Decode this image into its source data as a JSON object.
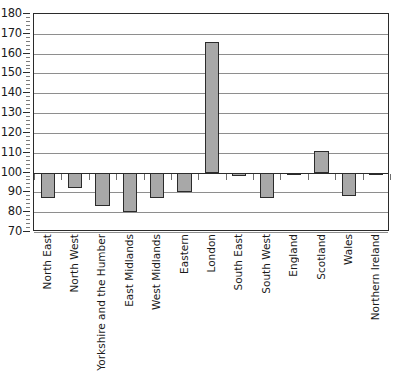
{
  "chart_data": {
    "type": "bar",
    "title": "",
    "subtitle": "",
    "xlabel": "",
    "ylabel": "",
    "categories": [
      "North East",
      "North West",
      "Yorkshire and the Humber",
      "East Midlands",
      "West Midlands",
      "Eastern",
      "London",
      "South East",
      "South West",
      "England",
      "Scotland",
      "Wales",
      "Northern Ireland"
    ],
    "values": [
      87,
      92,
      83,
      80,
      87,
      90,
      166,
      98,
      87,
      99,
      111,
      88,
      100
    ],
    "baseline": 100,
    "ylim": [
      70,
      180
    ],
    "ytick_labels": [
      "180",
      "170",
      "160",
      "150",
      "140",
      "130",
      "120",
      "110",
      "100",
      "90",
      "80",
      "70"
    ],
    "ytick_values": [
      180,
      170,
      160,
      150,
      140,
      130,
      120,
      110,
      100,
      90,
      80,
      70
    ],
    "ytick_step": 10,
    "yminor_step": 2,
    "grid": true,
    "legend": false,
    "legend_position": "none",
    "bar_fill_color": "#a8a8a8",
    "bar_border_color": "#2b2b2b",
    "gridline_color": "#8e8e8e",
    "frame_color": "#2b2b2b",
    "background_color": "#ffffff",
    "text_color": "#1a1a1a"
  }
}
